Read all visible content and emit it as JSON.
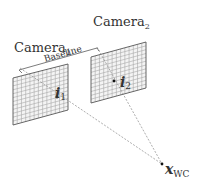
{
  "diagram": {
    "camera1": {
      "label": "Camera",
      "subscript": "1"
    },
    "camera2": {
      "label": "Camera",
      "subscript": "2"
    },
    "baseline": {
      "label": "Baseline"
    },
    "image_point_1": {
      "symbol": "i",
      "subscript": "1"
    },
    "image_point_2": {
      "symbol": "i",
      "subscript": "2"
    },
    "world_point": {
      "symbol": "x",
      "subscript": "WC"
    },
    "colors": {
      "grid": "#9a9a9a",
      "frame": "#555555",
      "dashed": "#8a8a8a",
      "text": "#333333",
      "point": "#111111"
    }
  }
}
